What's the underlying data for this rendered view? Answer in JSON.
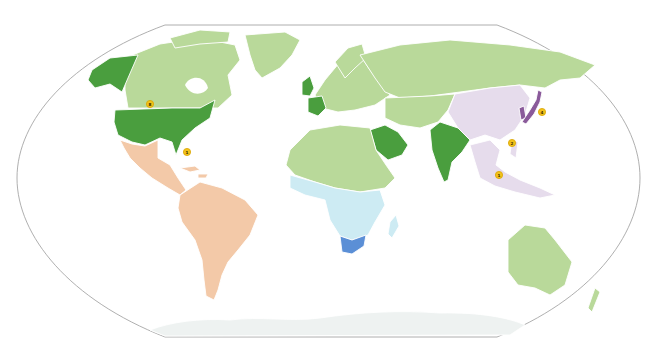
{
  "map": {
    "projection": "Robinson-style world map",
    "colors": {
      "background": "#ffffff",
      "outline": "#9a9a9a",
      "other_countries": "#b9d99a",
      "highlight_dark_green": "#4a9e3e",
      "latin_america": "#f3c9a8",
      "sub_saharan_africa": "#cdebf3",
      "south_africa": "#5b8fd6",
      "east_southeast_asia": "#e6dcec",
      "japan": "#8a5a9a",
      "antarctica": "#eef2f1",
      "badge": "#f2c21b"
    },
    "highlighted_countries": [
      {
        "name": "United States",
        "color_key": "highlight_dark_green"
      },
      {
        "name": "Alaska",
        "color_key": "highlight_dark_green"
      },
      {
        "name": "United Kingdom",
        "color_key": "highlight_dark_green"
      },
      {
        "name": "France",
        "color_key": "highlight_dark_green"
      },
      {
        "name": "Saudi Arabia",
        "color_key": "highlight_dark_green"
      },
      {
        "name": "India",
        "color_key": "highlight_dark_green"
      },
      {
        "name": "South Africa",
        "color_key": "south_africa"
      },
      {
        "name": "Japan",
        "color_key": "japan"
      }
    ],
    "regions": [
      {
        "name": "Latin America",
        "color_key": "latin_america"
      },
      {
        "name": "Sub-Saharan Africa",
        "color_key": "sub_saharan_africa"
      },
      {
        "name": "East & Southeast Asia",
        "color_key": "east_southeast_asia"
      },
      {
        "name": "Rest of world",
        "color_key": "other_countries"
      }
    ],
    "badges": [
      {
        "label": "8",
        "location": "United States"
      },
      {
        "label": "1",
        "location": "Caribbean"
      },
      {
        "label": "4",
        "location": "Japan"
      },
      {
        "label": "2",
        "location": "Philippines"
      },
      {
        "label": "1",
        "location": "Indonesia"
      }
    ]
  }
}
